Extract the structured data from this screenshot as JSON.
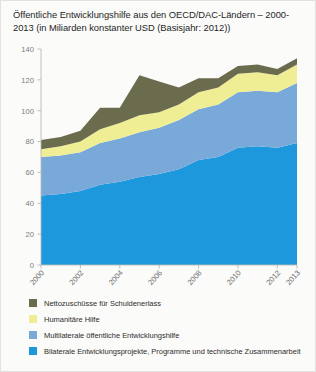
{
  "title": "Öffentliche Entwicklungshilfe aus den OECD/DAC-Ländern – 2000-2013 (in Miliarden konstanter USD (Basisjahr: 2012))",
  "legend": [
    {
      "label": "Nettozuschüsse für Schuldenerlass",
      "color": "#6b6b4e"
    },
    {
      "label": "Humanitäre Hilfe",
      "color": "#f0ee94"
    },
    {
      "label": "Multilaterale öffentliche Entwicklungshilfe",
      "color": "#79a9d8"
    },
    {
      "label": "Bilaterale Entwicklungsprojekte, Programme und technische Zusammenarbeit",
      "color": "#1d98dd"
    }
  ],
  "chart_data": {
    "type": "area",
    "stacked": true,
    "title": "Öffentliche Entwicklungshilfe aus den OECD/DAC-Ländern – 2000-2013 (in Miliarden konstanter USD (Basisjahr: 2012))",
    "xlabel": "",
    "ylabel": "",
    "ylim": [
      0,
      140
    ],
    "yticks": [
      0,
      20,
      40,
      60,
      80,
      100,
      120,
      140
    ],
    "grid": false,
    "legend_position": "below",
    "x": [
      2000,
      2001,
      2002,
      2003,
      2004,
      2005,
      2006,
      2007,
      2008,
      2009,
      2010,
      2011,
      2012,
      2013
    ],
    "xtick_labels": [
      "2000",
      "2002",
      "2004",
      "2006",
      "2008",
      "2010",
      "2012",
      "2013"
    ],
    "xtick_values": [
      2000,
      2002,
      2004,
      2006,
      2008,
      2010,
      2012,
      2013
    ],
    "annotations": [
      {
        "text": "(vorläufig)",
        "x": 2013,
        "note": "provisional data marker below 2013 tick"
      }
    ],
    "series": [
      {
        "name": "Bilaterale Entwicklungsprojekte, Programme und technische Zusammenarbeit",
        "color": "#1d98dd",
        "values": [
          45,
          46,
          48,
          52,
          54,
          57,
          59,
          62,
          68,
          70,
          76,
          77,
          76,
          79
        ]
      },
      {
        "name": "Multilaterale öffentliche Entwicklungshilfe",
        "color": "#79a9d8",
        "values": [
          25,
          25,
          25,
          27,
          28,
          29,
          30,
          32,
          33,
          34,
          36,
          36,
          36,
          39
        ]
      },
      {
        "name": "Humanitäre Hilfe",
        "color": "#f0ee94",
        "values": [
          5,
          6,
          7,
          9,
          10,
          11,
          10,
          10,
          11,
          11,
          12,
          12,
          11,
          12
        ]
      },
      {
        "name": "Nettozuschüsse für Schuldenerlass",
        "color": "#6b6b4e",
        "values": [
          6,
          6,
          7,
          14,
          10,
          26,
          20,
          11,
          9,
          6,
          5,
          5,
          4,
          4
        ]
      }
    ],
    "totals": [
      81,
      83,
      87,
      102,
      102,
      123,
      119,
      115,
      121,
      121,
      129,
      130,
      127,
      134
    ]
  }
}
